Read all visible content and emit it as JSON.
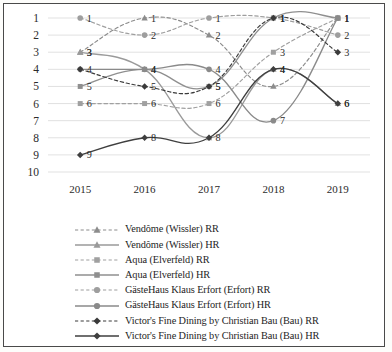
{
  "chart_data": {
    "type": "line",
    "title": "",
    "xlabel": "",
    "ylabel": "",
    "categories": [
      "2015",
      "2016",
      "2017",
      "2018",
      "2019"
    ],
    "x": [
      2015,
      2016,
      2017,
      2018,
      2019
    ],
    "ylim": [
      1,
      10
    ],
    "y_inverted": true,
    "y_ticks": [
      "1",
      "2",
      "3",
      "4",
      "5",
      "6",
      "7",
      "8",
      "9",
      "10"
    ],
    "grid": true,
    "legend_position": "bottom",
    "series": [
      {
        "name": "Vendôme (Wissler) RR",
        "marker": "triangle",
        "line": "dashed",
        "color": "#8c8c8c",
        "x": [
          "2015",
          "2016",
          "2017",
          "2018",
          "2019"
        ],
        "values": [
          3,
          1,
          2,
          5,
          1
        ],
        "labels": [
          "3",
          "1",
          "2",
          "",
          "1"
        ]
      },
      {
        "name": "Vendôme (Wissler) HR",
        "marker": "triangle",
        "line": "solid",
        "color": "#9a9a9a",
        "x": [
          "2015",
          "2016",
          "2017",
          "2018",
          "2019"
        ],
        "values": [
          3,
          4,
          8,
          4,
          6
        ],
        "labels": [
          "3",
          "",
          "",
          "4",
          "6"
        ]
      },
      {
        "name": "Aqua (Elverfeld) RR",
        "marker": "square",
        "line": "dashed",
        "color": "#a0a0a0",
        "x": [
          "2015",
          "2016",
          "2017",
          "2018",
          "2019"
        ],
        "values": [
          6,
          6,
          6,
          3,
          1
        ],
        "labels": [
          "6",
          "6",
          "6",
          "3",
          "1"
        ]
      },
      {
        "name": "Aqua (Elverfeld) HR",
        "marker": "square",
        "line": "solid",
        "color": "#8f8f8f",
        "x": [
          "2015",
          "2016",
          "2017",
          "2018",
          "2019"
        ],
        "values": [
          5,
          4,
          5,
          1,
          1
        ],
        "labels": [
          "5",
          "4",
          "5",
          "1",
          "1"
        ]
      },
      {
        "name": "GästeHaus Klaus Erfort (Erfort) RR",
        "marker": "circle",
        "line": "dashed",
        "color": "#9e9e9e",
        "x": [
          "2015",
          "2016",
          "2017",
          "2018",
          "2019"
        ],
        "values": [
          1,
          2,
          1,
          1,
          2
        ],
        "labels": [
          "1",
          "2",
          "1",
          "1",
          "2"
        ]
      },
      {
        "name": "GästeHaus Klaus Erfort (Erfort) HR",
        "marker": "circle",
        "line": "solid",
        "color": "#8a8a8a",
        "x": [
          "2015",
          "2016",
          "2017",
          "2018",
          "2019"
        ],
        "values": [
          4,
          4,
          4,
          7,
          1
        ],
        "labels": [
          "4",
          "4",
          "4",
          "7",
          ""
        ]
      },
      {
        "name": "Victor's Fine Dining by Christian Bau (Bau) RR",
        "marker": "diamond",
        "line": "dashed",
        "color": "#3a3a3a",
        "x": [
          "2015",
          "2016",
          "2017",
          "2018",
          "2019"
        ],
        "values": [
          4,
          5,
          5,
          1,
          3
        ],
        "labels": [
          "",
          "5",
          "5",
          "1",
          "3"
        ]
      },
      {
        "name": "Victor's Fine Dining by Christian Bau (Bau) HR",
        "marker": "diamond",
        "line": "solid",
        "color": "#3f3f3f",
        "x": [
          "2015",
          "2016",
          "2017",
          "2018",
          "2019"
        ],
        "values": [
          9,
          8,
          8,
          4,
          6
        ],
        "labels": [
          "9",
          "8",
          "8",
          "4",
          "6"
        ]
      }
    ]
  },
  "legend": {
    "items": [
      {
        "label": "Vendôme (Wissler) RR"
      },
      {
        "label": "Vendôme (Wissler) HR"
      },
      {
        "label": "Aqua (Elverfeld) RR"
      },
      {
        "label": "Aqua (Elverfeld) HR"
      },
      {
        "label": "GästeHaus Klaus Erfort (Erfort) RR"
      },
      {
        "label": "GästeHaus Klaus Erfort (Erfort) HR"
      },
      {
        "label": "Victor's Fine Dining by Christian Bau (Bau) RR"
      },
      {
        "label": "Victor's Fine Dining by Christian Bau (Bau) HR"
      }
    ]
  }
}
